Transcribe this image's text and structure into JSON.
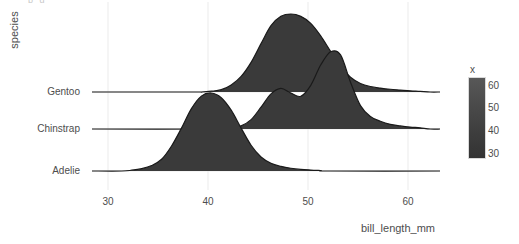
{
  "clipped_header": "p   g",
  "axes": {
    "y_title": "species",
    "x_title": "bill_length_mm",
    "y_categories": [
      "Gentoo",
      "Chinstrap",
      "Adelie"
    ],
    "x_ticks": [
      "30",
      "40",
      "50",
      "60"
    ]
  },
  "legend": {
    "title": "x",
    "ticks": [
      "60",
      "50",
      "40",
      "30"
    ],
    "gradient_low": "#333333",
    "gradient_high": "#585858"
  },
  "colors": {
    "fill": "#3a3a3a",
    "outline": "#1a1a1a",
    "gridline": "#ebebeb",
    "panel_bg": "#ffffff",
    "text": "#4d4d4d"
  },
  "chart_data": {
    "type": "area",
    "title": "",
    "subtype": "ridgeline",
    "xlabel": "bill_length_mm",
    "ylabel": "species",
    "xlim": [
      27,
      62
    ],
    "x_ticks": [
      30,
      40,
      50,
      60
    ],
    "grid": true,
    "legend_position": "right",
    "legend_title": "x",
    "legend_ticks": [
      30,
      40,
      50,
      60
    ],
    "series": [
      {
        "name": "Gentoo",
        "baseline_y": 92,
        "peak_x": 47,
        "modes": [
          47
        ],
        "x": [
          38,
          39,
          40,
          41,
          42,
          43,
          44,
          45,
          46,
          47,
          48,
          49,
          50,
          51,
          52,
          53,
          54,
          55,
          56,
          57,
          58,
          59,
          60
        ],
        "density": [
          0.0,
          0.01,
          0.03,
          0.09,
          0.2,
          0.38,
          0.62,
          0.85,
          0.97,
          1.0,
          0.97,
          0.88,
          0.72,
          0.52,
          0.33,
          0.19,
          0.11,
          0.07,
          0.05,
          0.035,
          0.025,
          0.015,
          0.008
        ]
      },
      {
        "name": "Chinstrap",
        "baseline_y": 129,
        "peak_x": 51,
        "modes": [
          46,
          51
        ],
        "x": [
          41,
          42,
          43,
          44,
          45,
          46,
          47,
          48,
          49,
          50,
          51,
          52,
          53,
          54,
          55,
          56,
          57,
          58,
          59,
          60
        ],
        "density": [
          0.01,
          0.04,
          0.12,
          0.28,
          0.45,
          0.52,
          0.46,
          0.42,
          0.56,
          0.82,
          0.99,
          0.95,
          0.6,
          0.3,
          0.16,
          0.1,
          0.06,
          0.04,
          0.025,
          0.015
        ]
      },
      {
        "name": "Adelie",
        "baseline_y": 171,
        "peak_x": 39,
        "modes": [
          39
        ],
        "x": [
          31,
          32,
          33,
          34,
          35,
          36,
          37,
          38,
          39,
          40,
          41,
          42,
          43,
          44,
          45,
          46,
          47,
          48,
          49,
          50
        ],
        "density": [
          0.01,
          0.03,
          0.07,
          0.15,
          0.32,
          0.55,
          0.8,
          0.96,
          1.0,
          0.94,
          0.78,
          0.55,
          0.33,
          0.18,
          0.1,
          0.06,
          0.035,
          0.02,
          0.012,
          0.006
        ]
      }
    ]
  }
}
